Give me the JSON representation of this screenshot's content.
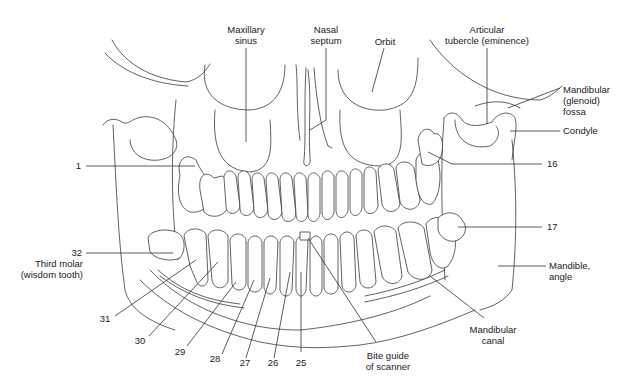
{
  "diagram": {
    "labels": {
      "maxillary_sinus": "Maxillary\nsinus",
      "nasal_septum": "Nasal\nseptum",
      "orbit": "Orbit",
      "articular_tubercle": "Articular\ntubercle (eminence)",
      "mandibular_fossa": "Mandibular\n(glenoid)\nfossa",
      "condyle": "Condyle",
      "tooth_16": "16",
      "tooth_17": "17",
      "mandible_angle": "Mandible,\nangle",
      "tooth_1": "1",
      "tooth_32": "32",
      "third_molar": "Third molar\n(wisdom tooth)",
      "tooth_31": "31",
      "tooth_30": "30",
      "tooth_29": "29",
      "tooth_28": "28",
      "tooth_27": "27",
      "tooth_26": "26",
      "tooth_25": "25",
      "bite_guide": "Bite guide\nof scanner",
      "mandibular_canal": "Mandibular\ncanal"
    },
    "colors": {
      "line": "#3a3a3a",
      "text": "#222222",
      "background": "#ffffff"
    }
  }
}
